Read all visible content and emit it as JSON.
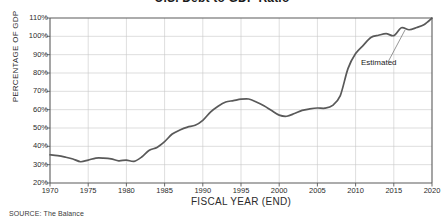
{
  "chart_title": "U.S. Debt to GDP Ratio",
  "axes": {
    "y_title": "PERCENTAGE OF GDP",
    "x_title": "FISCAL YEAR (END)"
  },
  "source": "SOURCE: The Balance",
  "annotation": {
    "label": "Estimated"
  },
  "chart_data": {
    "type": "line",
    "title": "U.S. Debt to GDP Ratio",
    "xlabel": "FISCAL YEAR (END)",
    "ylabel": "PERCENTAGE OF GDP",
    "xlim": [
      1970,
      2020
    ],
    "ylim": [
      20,
      110
    ],
    "grid": true,
    "legend": null,
    "y_ticks": [
      "20%",
      "30%",
      "40%",
      "50%",
      "60%",
      "70%",
      "80%",
      "90%",
      "100%",
      "110%"
    ],
    "y_tick_values": [
      20,
      30,
      40,
      50,
      60,
      70,
      80,
      90,
      100,
      110
    ],
    "x_ticks": [
      "1970",
      "1975",
      "1980",
      "1985",
      "1990",
      "1995",
      "2000",
      "2005",
      "2010",
      "2015",
      "2020"
    ],
    "x_tick_values": [
      1970,
      1975,
      1980,
      1985,
      1990,
      1995,
      2000,
      2005,
      2010,
      2015,
      2020
    ],
    "line_color": "#595959",
    "grid_color": "#c8c8c8",
    "annotations": [
      {
        "text": "Estimated",
        "x": 2020,
        "y": 110
      }
    ],
    "x": [
      1970,
      1971,
      1972,
      1973,
      1974,
      1975,
      1976,
      1977,
      1978,
      1979,
      1980,
      1981,
      1982,
      1983,
      1984,
      1985,
      1986,
      1987,
      1988,
      1989,
      1990,
      1991,
      1992,
      1993,
      1994,
      1995,
      1996,
      1997,
      1998,
      1999,
      2000,
      2001,
      2002,
      2003,
      2004,
      2005,
      2006,
      2007,
      2008,
      2009,
      2010,
      2011,
      2012,
      2013,
      2014,
      2015,
      2016,
      2017,
      2018,
      2019,
      2020
    ],
    "values": [
      35.4,
      34.9,
      34.1,
      33.1,
      31.6,
      32.5,
      33.6,
      33.6,
      33.2,
      32.1,
      32.5,
      31.8,
      34.2,
      37.9,
      39.4,
      42.6,
      46.7,
      48.9,
      50.5,
      51.5,
      54.2,
      58.7,
      61.9,
      64.2,
      64.9,
      65.7,
      65.8,
      64.2,
      62.1,
      59.5,
      57.0,
      56.4,
      57.9,
      59.6,
      60.4,
      60.9,
      60.8,
      62.3,
      67.7,
      82.4,
      90.6,
      95.1,
      99.4,
      100.6,
      101.5,
      100.4,
      104.7,
      103.6,
      104.8,
      106.5,
      110.0
    ]
  }
}
